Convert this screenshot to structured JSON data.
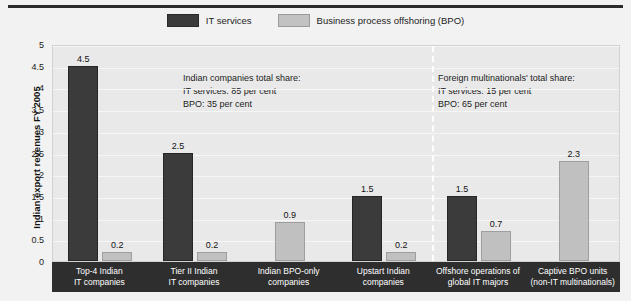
{
  "legend": {
    "items": [
      {
        "label": "IT services",
        "color": "#3b3b3b",
        "icon": "legend-swatch-it"
      },
      {
        "label": "Business process offshoring (BPO)",
        "color": "#c0c0c0",
        "icon": "legend-swatch-bpo"
      }
    ]
  },
  "annotations": {
    "left": "Indian companies total share:\nIT services: 85 per cent\nBPO: 35 per cent",
    "right": "Foreign multinationals' total share:\nIT services: 15 per cent\nBPO: 65 per cent"
  },
  "chart_data": {
    "type": "bar",
    "title": "",
    "xlabel": "",
    "ylabel": "Indian export revenues FY 2005",
    "ylim": [
      0,
      5
    ],
    "yticks": [
      "0",
      "0.5",
      "1",
      "1.5",
      "2",
      "2.5",
      "3",
      "3.5",
      "4",
      "4.5",
      "5"
    ],
    "grid": true,
    "legend_position": "top-center",
    "categories": [
      "Top-4 Indian\nIT companies",
      "Tier II Indian\nIT companies",
      "Indian BPO-only\ncompanies",
      "Upstart Indian\ncompanies",
      "Offshore operations of\nglobal IT majors",
      "Captive BPO units\n(non-IT multinationals)"
    ],
    "series": [
      {
        "name": "IT services",
        "color": "#3b3b3b",
        "values": [
          4.5,
          2.5,
          null,
          1.5,
          1.5,
          null
        ]
      },
      {
        "name": "Business process offshoring (BPO)",
        "color": "#c0c0c0",
        "values": [
          0.2,
          0.2,
          0.9,
          0.2,
          0.7,
          2.3
        ]
      }
    ],
    "value_labels": [
      [
        "4.5",
        "0.2"
      ],
      [
        "2.5",
        "0.2"
      ],
      [
        null,
        "0.9"
      ],
      [
        "1.5",
        "0.2"
      ],
      [
        "1.5",
        "0.7"
      ],
      [
        null,
        "2.3"
      ]
    ],
    "divider": {
      "after_category_index": 3,
      "style": "dashed",
      "color": "#ffffff"
    }
  }
}
